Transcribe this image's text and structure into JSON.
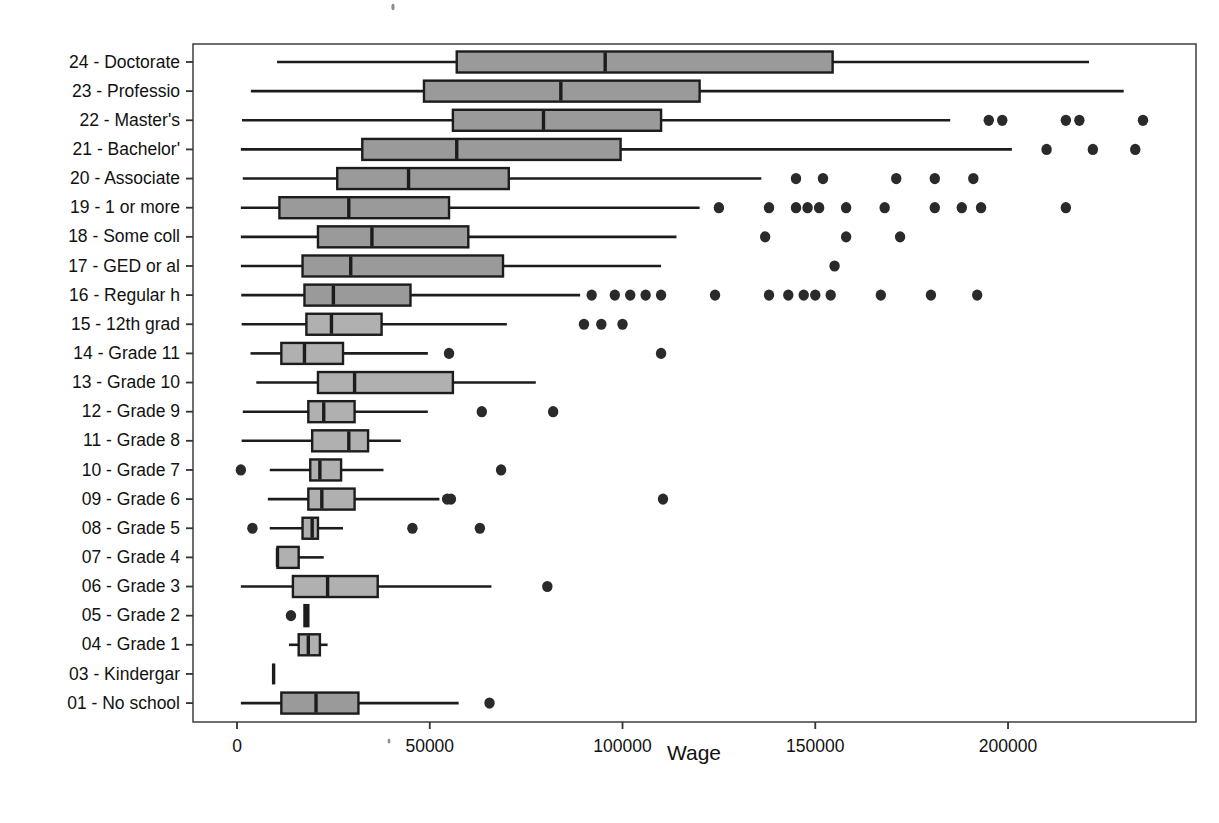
{
  "chart_data": {
    "type": "box",
    "title": "",
    "xlabel": "Wage",
    "ylabel": "",
    "xlim": [
      -8000,
      248000
    ],
    "xticks": [
      0,
      50000,
      100000,
      150000,
      200000
    ],
    "xticklabels": [
      "0",
      "50000",
      "100000",
      "150000",
      "200000"
    ],
    "grid": false,
    "orientation": "horizontal",
    "box_fill_dark": "#9a9a9a",
    "box_fill_light": "#b0b0b0",
    "line_color": "#1c1c1c",
    "categories": [
      "24 - Doctorate",
      "23 - Professio",
      "22 - Master's",
      "21 - Bachelor'",
      "20 - Associate",
      "19 - 1 or more",
      "18 - Some coll",
      "17 - GED or al",
      "16 - Regular h",
      "15 - 12th grad",
      "14 - Grade 11",
      "13 - Grade 10",
      "12 - Grade 9",
      "11 - Grade 8",
      "10 - Grade 7",
      "09 - Grade 6",
      "08 - Grade 5",
      "07 - Grade 4",
      "06 - Grade 3",
      "05 - Grade 2",
      "04 - Grade 1",
      "03 - Kindergar",
      "01 - No school"
    ],
    "boxes": [
      {
        "label": "24 - Doctorate",
        "shade": "dark",
        "whisker_low": 10400,
        "q1": 57000,
        "median": 95500,
        "q3": 154500,
        "whisker_high": 221000,
        "outliers": []
      },
      {
        "label": "23 - Professio",
        "shade": "dark",
        "whisker_low": 3600,
        "q1": 48500,
        "median": 84000,
        "q3": 120000,
        "whisker_high": 230000,
        "outliers": []
      },
      {
        "label": "22 - Master's",
        "shade": "dark",
        "whisker_low": 1300,
        "q1": 56000,
        "median": 79500,
        "q3": 110000,
        "whisker_high": 185000,
        "outliers": [
          195000,
          198500,
          215000,
          218500,
          235000
        ]
      },
      {
        "label": "21 - Bachelor'",
        "shade": "dark",
        "whisker_low": 1000,
        "q1": 32500,
        "median": 57000,
        "q3": 99500,
        "whisker_high": 201000,
        "outliers": [
          210000,
          222000,
          233000
        ]
      },
      {
        "label": "20 - Associate",
        "shade": "dark",
        "whisker_low": 1500,
        "q1": 26000,
        "median": 44500,
        "q3": 70500,
        "whisker_high": 136000,
        "outliers": [
          145000,
          152000,
          171000,
          181000,
          191000
        ]
      },
      {
        "label": "19 - 1 or more",
        "shade": "dark",
        "whisker_low": 1000,
        "q1": 11000,
        "median": 29000,
        "q3": 55000,
        "whisker_high": 120000,
        "outliers": [
          125000,
          138000,
          145000,
          148000,
          151000,
          158000,
          168000,
          181000,
          188000,
          193000,
          215000
        ]
      },
      {
        "label": "18 - Some coll",
        "shade": "dark",
        "whisker_low": 1000,
        "q1": 21000,
        "median": 35000,
        "q3": 60000,
        "whisker_high": 114000,
        "outliers": [
          137000,
          158000,
          172000
        ]
      },
      {
        "label": "17 - GED or al",
        "shade": "dark",
        "whisker_low": 1000,
        "q1": 17000,
        "median": 29500,
        "q3": 69000,
        "whisker_high": 110000,
        "outliers": [
          155000
        ]
      },
      {
        "label": "16 - Regular h",
        "shade": "dark",
        "whisker_low": 1100,
        "q1": 17500,
        "median": 25000,
        "q3": 45000,
        "whisker_high": 89000,
        "outliers": [
          92000,
          98000,
          102000,
          106000,
          110000,
          124000,
          138000,
          143000,
          147000,
          150000,
          154000,
          167000,
          180000,
          192000
        ]
      },
      {
        "label": "15 - 12th grad",
        "shade": "light",
        "whisker_low": 1200,
        "q1": 18000,
        "median": 24500,
        "q3": 37500,
        "whisker_high": 70000,
        "outliers": [
          90000,
          94500,
          100000
        ]
      },
      {
        "label": "14 - Grade 11",
        "shade": "light",
        "whisker_low": 3500,
        "q1": 11500,
        "median": 17500,
        "q3": 27500,
        "whisker_high": 49500,
        "outliers": [
          55000,
          110000
        ]
      },
      {
        "label": "13 - Grade 10",
        "shade": "light",
        "whisker_low": 5000,
        "q1": 21000,
        "median": 30500,
        "q3": 56000,
        "whisker_high": 77500,
        "outliers": []
      },
      {
        "label": "12 - Grade 9",
        "shade": "light",
        "whisker_low": 1500,
        "q1": 18500,
        "median": 22500,
        "q3": 30500,
        "whisker_high": 49500,
        "outliers": [
          63500,
          82000
        ]
      },
      {
        "label": "11 - Grade 8",
        "shade": "light",
        "whisker_low": 1200,
        "q1": 19500,
        "median": 29000,
        "q3": 34000,
        "whisker_high": 42500,
        "outliers": []
      },
      {
        "label": "10 - Grade 7",
        "shade": "light",
        "whisker_low": 8500,
        "q1": 19000,
        "median": 21500,
        "q3": 27000,
        "whisker_high": 38000,
        "outliers": [
          1000,
          68500
        ]
      },
      {
        "label": "09 - Grade 6",
        "shade": "light",
        "whisker_low": 8000,
        "q1": 18500,
        "median": 22000,
        "q3": 30500,
        "whisker_high": 52500,
        "outliers": [
          54500,
          55500,
          110500
        ]
      },
      {
        "label": "08 - Grade 5",
        "shade": "light",
        "whisker_low": 8500,
        "q1": 17000,
        "median": 19500,
        "q3": 21000,
        "whisker_high": 27500,
        "outliers": [
          4000,
          45500,
          63000
        ]
      },
      {
        "label": "07 - Grade 4",
        "shade": "light",
        "whisker_low": 10500,
        "q1": 10500,
        "median": 10500,
        "q3": 16000,
        "whisker_high": 22500,
        "outliers": []
      },
      {
        "label": "06 - Grade 3",
        "shade": "light",
        "whisker_low": 1000,
        "q1": 14500,
        "median": 23500,
        "q3": 36500,
        "whisker_high": 66000,
        "outliers": [
          80500
        ]
      },
      {
        "label": "05 - Grade 2",
        "shade": "light",
        "whisker_low": 17500,
        "q1": 17500,
        "median": 18000,
        "q3": 18500,
        "whisker_high": 18500,
        "outliers": [
          14000
        ]
      },
      {
        "label": "04 - Grade 1",
        "shade": "light",
        "whisker_low": 13500,
        "q1": 16000,
        "median": 18500,
        "q3": 21500,
        "whisker_high": 23500,
        "outliers": []
      },
      {
        "label": "03 - Kindergar",
        "shade": "light",
        "whisker_low": 9500,
        "q1": 9500,
        "median": 9500,
        "q3": 9500,
        "whisker_high": 9500,
        "outliers": []
      },
      {
        "label": "01 - No school",
        "shade": "dark",
        "whisker_low": 1000,
        "q1": 11500,
        "median": 20500,
        "q3": 31500,
        "whisker_high": 57500,
        "outliers": [
          65500
        ]
      }
    ]
  },
  "geometry": {
    "plot_left": 193,
    "plot_right": 1196,
    "plot_top": 44,
    "plot_bottom": 722,
    "x_zero_px": 237,
    "px_per_unit": 0.0038552,
    "row_first_y": 62,
    "row_spacing": 29.14,
    "box_half_height": 10.5,
    "outlier_rx": 5.2,
    "outlier_ry": 5.6,
    "xlabel_y": 760,
    "xtick_label_y": 746
  }
}
